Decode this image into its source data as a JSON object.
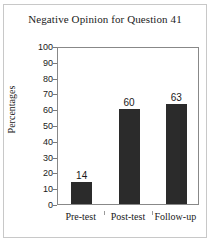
{
  "chart_data": {
    "type": "bar",
    "title": "Negative Opinion for Question 41",
    "xlabel": "",
    "ylabel": "Percentages",
    "categories": [
      "Pre-test",
      "Post-test",
      "Follow-up"
    ],
    "values": [
      14,
      60,
      63
    ],
    "data_labels": [
      "14",
      "60",
      "63"
    ],
    "ylim": [
      0,
      100
    ],
    "ytick_step": 10,
    "yticks": [
      "0",
      "10",
      "20",
      "30",
      "40",
      "50",
      "60",
      "70",
      "80",
      "90",
      "100"
    ],
    "grid": false,
    "legend": null,
    "bar_color": "#2b2b2b",
    "plot_border_color": "#888888",
    "figure_border_color": "#c8c8c8",
    "text_color": "#1a1a1a"
  }
}
